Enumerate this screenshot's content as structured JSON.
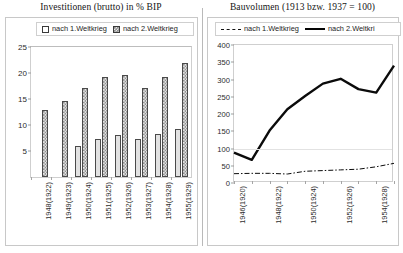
{
  "left_chart": {
    "title": "Investitionen (brutto) in % BIP",
    "legend": [
      {
        "label": "nach 1.Weltkrieg",
        "swatch": "white-square-icon"
      },
      {
        "label": "nach 2.Weltkrieg",
        "swatch": "hatched-square-icon"
      }
    ]
  },
  "right_chart": {
    "title": "Bauvolumen (1913 bzw. 1937 = 100)",
    "legend": [
      {
        "label": "nach 1.Weltkrieg",
        "swatch": "dash-dot-line-icon"
      },
      {
        "label": "nach 2.Weltkri",
        "swatch": "bold-line-icon"
      }
    ]
  },
  "chart_data": [
    {
      "type": "bar",
      "title": "Investitionen (brutto) in % BIP",
      "xlabel": "",
      "ylabel": "",
      "ylim": [
        0,
        25
      ],
      "yticks": [
        5,
        10,
        15,
        20,
        25
      ],
      "grid": false,
      "legend_position": "top",
      "categories": [
        "1948(1922)",
        "1949(1923)",
        "1950(1924)",
        "1951(1925)",
        "1952(1926)",
        "1953(1927)",
        "1954(1928)",
        "1955(1929)"
      ],
      "series": [
        {
          "name": "nach 1.Weltkrieg",
          "values": [
            0,
            0,
            6.0,
            7.3,
            8.0,
            7.4,
            8.3,
            9.2
          ]
        },
        {
          "name": "nach 2.Weltkrieg",
          "values": [
            12.9,
            14.6,
            17.1,
            19.3,
            19.6,
            17.1,
            19.3,
            21.9
          ]
        }
      ]
    },
    {
      "type": "line",
      "title": "Bauvolumen (1913 bzw. 1937 = 100)",
      "xlabel": "",
      "ylabel": "",
      "ylim": [
        0,
        400
      ],
      "yticks": [
        0,
        50,
        100,
        150,
        200,
        250,
        300,
        350,
        400
      ],
      "grid": true,
      "legend_position": "top",
      "xticks_labeled": [
        "1946(1920)",
        "1948(1922)",
        "1950(1924)",
        "1952(1926)",
        "1954(1928)"
      ],
      "x": [
        "1946(1920)",
        "1947(1921)",
        "1948(1922)",
        "1949(1923)",
        "1950(1924)",
        "1951(1925)",
        "1952(1926)",
        "1953(1927)",
        "1954(1928)",
        "1955(1929)"
      ],
      "series": [
        {
          "name": "nach 1.Weltkrieg",
          "style": "dash-dot",
          "values": [
            27,
            28,
            28,
            26,
            34,
            36,
            38,
            40,
            47,
            57
          ]
        },
        {
          "name": "nach 2.Weltkri",
          "style": "bold-solid",
          "values": [
            88,
            67,
            152,
            214,
            252,
            288,
            302,
            272,
            262,
            340
          ]
        }
      ]
    }
  ]
}
